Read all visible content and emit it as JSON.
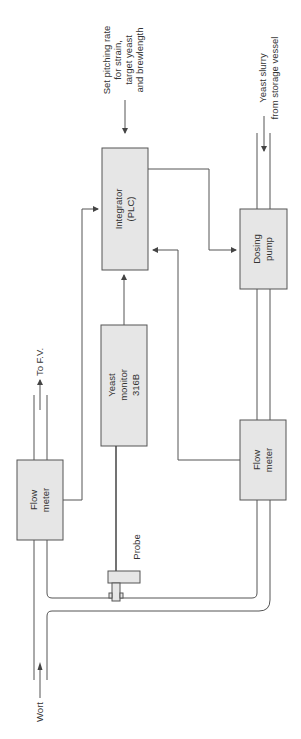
{
  "diagram": {
    "type": "process-control-schematic",
    "orientation": "rotated-90-ccw",
    "nodes": {
      "integrator": {
        "line1": "Integrator",
        "line2": "(PLC)"
      },
      "yeast_monitor": {
        "line1": "Yeast",
        "line2": "monitor",
        "line3": "316B"
      },
      "flow_meter_wort": {
        "line1": "Flow",
        "line2": "meter"
      },
      "flow_meter_slurry": {
        "line1": "Flow",
        "line2": "meter"
      },
      "dosing_pump": {
        "line1": "Dosing",
        "line2": "pump"
      },
      "probe": {
        "label": "Probe"
      }
    },
    "labels": {
      "setpoint": {
        "line1": "Set pitching rate",
        "line2": "for strain,",
        "line3": "target yeast",
        "line4": "and brewlength"
      },
      "slurry_in": {
        "line1": "Yeast slurry",
        "line2": "from storage vessel"
      },
      "to_fv": "To F.V.",
      "wort": "Wort"
    },
    "edges": [
      {
        "from": "setpoint",
        "to": "integrator"
      },
      {
        "from": "yeast_monitor",
        "to": "integrator"
      },
      {
        "from": "flow_meter_wort",
        "to": "integrator"
      },
      {
        "from": "flow_meter_slurry",
        "to": "integrator"
      },
      {
        "from": "integrator",
        "to": "dosing_pump"
      },
      {
        "from": "probe",
        "to": "yeast_monitor"
      },
      {
        "from": "slurry_in",
        "to": "dosing_pump",
        "kind": "pipe"
      },
      {
        "from": "dosing_pump",
        "to": "flow_meter_slurry",
        "kind": "pipe"
      },
      {
        "from": "flow_meter_slurry",
        "to": "wort_main",
        "kind": "pipe"
      },
      {
        "from": "wort",
        "to": "flow_meter_wort",
        "kind": "pipe"
      },
      {
        "from": "flow_meter_wort",
        "to": "to_fv",
        "kind": "pipe"
      }
    ]
  }
}
